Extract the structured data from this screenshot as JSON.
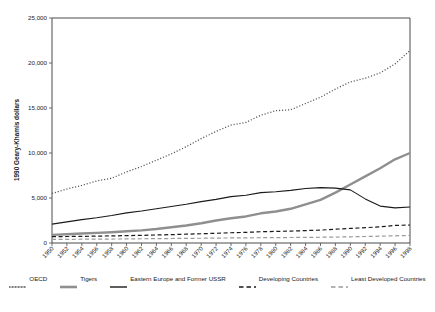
{
  "chart_data": {
    "type": "line",
    "title": "",
    "xlabel": "",
    "ylabel": "1990 Geary-Khamis dollars",
    "ylim": [
      0,
      25000
    ],
    "ytick_values": [
      0,
      5000,
      10000,
      15000,
      20000,
      25000
    ],
    "ytick_labels": [
      "0",
      "5,000",
      "10,000",
      "15,000",
      "20,000",
      "25,000"
    ],
    "grid": false,
    "legend_position": "bottom",
    "x": [
      1950,
      1952,
      1954,
      1956,
      1958,
      1960,
      1962,
      1964,
      1966,
      1968,
      1970,
      1972,
      1974,
      1976,
      1978,
      1980,
      1982,
      1984,
      1986,
      1988,
      1990,
      1992,
      1994,
      1996,
      1998
    ],
    "categories": [
      "1950",
      "1952",
      "1954",
      "1956",
      "1958",
      "1960",
      "1962",
      "1964",
      "1966",
      "1968",
      "1970",
      "1972",
      "1974",
      "1976",
      "1978",
      "1980",
      "1982",
      "1984",
      "1986",
      "1988",
      "1990",
      "1992",
      "1994",
      "1996",
      "1998"
    ],
    "series": [
      {
        "name": "OECD",
        "style": "dotted",
        "color": "#555555",
        "width": 1.3,
        "values": [
          5500,
          6000,
          6400,
          6900,
          7200,
          7900,
          8500,
          9200,
          9900,
          10700,
          11600,
          12400,
          13100,
          13400,
          14200,
          14700,
          14800,
          15500,
          16200,
          17100,
          17900,
          18300,
          18900,
          19900,
          21400
        ]
      },
      {
        "name": "Tigers",
        "style": "solid",
        "color": "#8f8f8f",
        "width": 2.4,
        "values": [
          900,
          980,
          1050,
          1120,
          1200,
          1300,
          1400,
          1550,
          1750,
          1950,
          2200,
          2500,
          2750,
          2950,
          3300,
          3500,
          3800,
          4300,
          4800,
          5600,
          6500,
          7400,
          8300,
          9300,
          10000
        ]
      },
      {
        "name": "Eastern Europe and Former USSR",
        "style": "solid",
        "color": "#1a1a1a",
        "width": 1.1,
        "values": [
          2100,
          2350,
          2600,
          2800,
          3050,
          3350,
          3550,
          3800,
          4050,
          4300,
          4600,
          4850,
          5150,
          5300,
          5600,
          5700,
          5850,
          6050,
          6150,
          6100,
          5900,
          4900,
          4100,
          3900,
          4000
        ]
      },
      {
        "name": "Developing Countries",
        "style": "dashed",
        "color": "#1a1a1a",
        "width": 1.2,
        "values": [
          700,
          720,
          740,
          760,
          790,
          820,
          850,
          890,
          930,
          980,
          1030,
          1080,
          1140,
          1180,
          1250,
          1290,
          1320,
          1380,
          1430,
          1530,
          1620,
          1700,
          1800,
          1950,
          2000
        ]
      },
      {
        "name": "Least Developed Countries",
        "style": "dashed",
        "color": "#9a9a9a",
        "width": 1.2,
        "values": [
          400,
          410,
          420,
          430,
          440,
          455,
          470,
          485,
          500,
          515,
          530,
          545,
          560,
          570,
          590,
          600,
          610,
          625,
          640,
          660,
          690,
          720,
          760,
          800,
          840
        ]
      }
    ]
  },
  "legend": {
    "items": [
      {
        "label": "OECD",
        "style": "dotted",
        "color": "#555555",
        "width": 1.4
      },
      {
        "label": "Tigers",
        "style": "solid",
        "color": "#8f8f8f",
        "width": 2.6
      },
      {
        "label": "Eastern Europe and Former USSR",
        "style": "solid",
        "color": "#1a1a1a",
        "width": 1.4
      },
      {
        "label": "Developing Countries",
        "style": "dashed",
        "color": "#1a1a1a",
        "width": 1.3
      },
      {
        "label": "Least Developed Countries",
        "style": "dashed",
        "color": "#9a9a9a",
        "width": 1.3
      }
    ]
  },
  "caption": {
    "text": ""
  }
}
